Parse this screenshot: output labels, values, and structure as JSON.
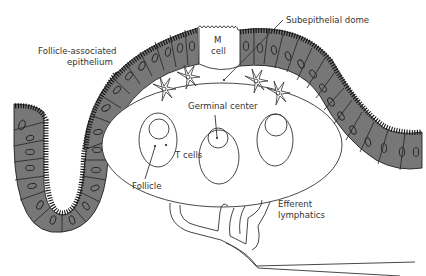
{
  "figure": {
    "labels": {
      "fae_line1": "Follicle-associated",
      "fae_line2": "epithelium",
      "m_cell_line1": "M",
      "m_cell_line2": "cell",
      "subepithelial_dome": "Subepithelial dome",
      "germinal_center": "Germinal center",
      "t_cells": "T cells",
      "follicle": "Follicle",
      "efferent_line1": "Efferent",
      "efferent_line2": "lymphatics"
    },
    "colors": {
      "epithelium_fill": "#777777",
      "outline": "#222222",
      "background": "#ffffff",
      "text": "#333333"
    },
    "structures": [
      "follicle-associated-epithelium",
      "crypt",
      "m-cell",
      "subepithelial-dome",
      "dendritic-cells",
      "follicles",
      "germinal-centers",
      "efferent-lymphatics"
    ]
  }
}
